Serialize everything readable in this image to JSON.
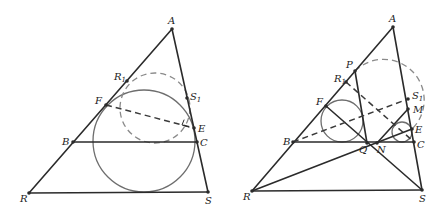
{
  "figures": [
    {
      "name": "left-figure",
      "labels": {
        "A": "A",
        "R1": "R",
        "R1_sub": "1",
        "S1": "S",
        "S1_sub": "1",
        "F": "F",
        "E": "E",
        "B": "B",
        "C": "C",
        "R": "R",
        "S": "S"
      }
    },
    {
      "name": "right-figure",
      "labels": {
        "A": "A",
        "P": "P",
        "R1": "R",
        "R1_sub": "1",
        "S1": "S",
        "S1_sub": "1",
        "M": "M",
        "F": "F",
        "E": "E",
        "B": "B",
        "C": "C",
        "Q": "Q",
        "N": "N",
        "R": "R",
        "S": "S"
      }
    }
  ]
}
